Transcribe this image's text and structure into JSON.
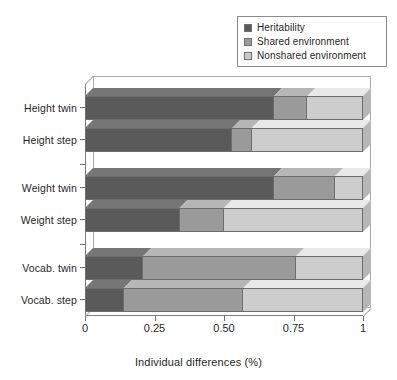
{
  "chart_data": {
    "type": "bar",
    "orientation": "horizontal",
    "stacked": true,
    "title": "",
    "xlabel": "Individual differences (%)",
    "ylabel": "",
    "xlim": [
      0,
      1
    ],
    "xticks": [
      0,
      0.25,
      0.5,
      0.75,
      1
    ],
    "xtick_labels": [
      "0",
      "0.25",
      "0.50",
      "0.75",
      "1"
    ],
    "grid": false,
    "legend_position": "top-right",
    "categories": [
      "Height twin",
      "Height step",
      "Weight twin",
      "Weight step",
      "Vocab. twin",
      "Vocab. step"
    ],
    "series": [
      {
        "name": "Heritability",
        "color": "#5a5a5a",
        "values": [
          0.68,
          0.53,
          0.68,
          0.34,
          0.21,
          0.14
        ]
      },
      {
        "name": "Shared environment",
        "color": "#9a9a9a",
        "values": [
          0.12,
          0.07,
          0.22,
          0.16,
          0.55,
          0.43
        ]
      },
      {
        "name": "Nonshared environment",
        "color": "#cdcdcd",
        "values": [
          0.2,
          0.4,
          0.1,
          0.5,
          0.24,
          0.43
        ]
      }
    ]
  },
  "legend": {
    "items": [
      {
        "label": "Heritability",
        "color": "#5a5a5a"
      },
      {
        "label": "Shared environment",
        "color": "#9a9a9a"
      },
      {
        "label": "Nonshared environment",
        "color": "#cdcdcd"
      }
    ]
  },
  "axis": {
    "x_title": "Individual differences (%)",
    "x_tick_labels": [
      "0",
      "0.25",
      "0.50",
      "0.75",
      "1"
    ],
    "y_tick_labels": [
      "Height twin",
      "Height step",
      "Weight twin",
      "Weight step",
      "Vocab. twin",
      "Vocab. step"
    ]
  }
}
